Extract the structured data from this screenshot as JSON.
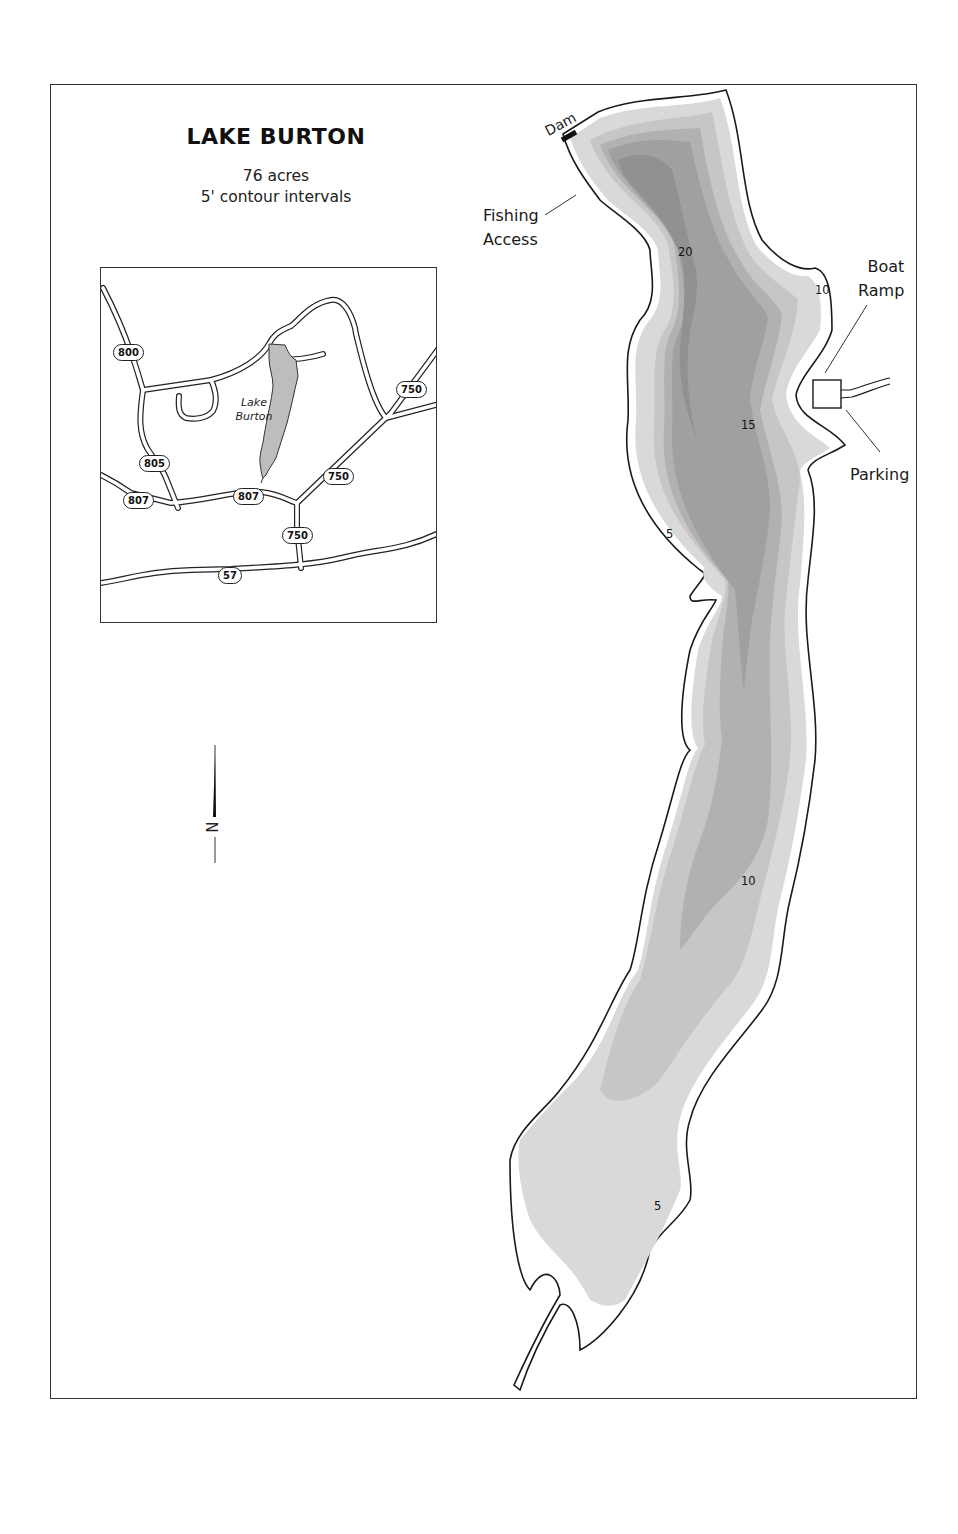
{
  "map": {
    "title": "LAKE BURTON",
    "area": "76 acres",
    "contour_note": "5' contour intervals",
    "north_label": "N"
  },
  "features": {
    "dam": "Dam",
    "fishing_access": [
      "Fishing",
      "Access"
    ],
    "boat_ramp": [
      "Boat",
      "Ramp"
    ],
    "parking": "Parking"
  },
  "depth_labels": [
    {
      "value": "20",
      "x": 678,
      "y": 245
    },
    {
      "value": "10",
      "x": 815,
      "y": 283
    },
    {
      "value": "15",
      "x": 741,
      "y": 418
    },
    {
      "value": "5",
      "x": 666,
      "y": 527
    },
    {
      "value": "10",
      "x": 741,
      "y": 874
    },
    {
      "value": "5",
      "x": 654,
      "y": 1199
    }
  ],
  "contour_colors": {
    "shore_0_5": "#d6d6d6",
    "depth_5_10": "#c4c4c4",
    "depth_10_15": "#b0b0b0",
    "depth_15_20": "#9e9e9e",
    "depth_20_plus": "#8f8f8f",
    "shoreline": "#1a1a1a"
  },
  "inset": {
    "lake_label": [
      "Lake",
      "Burton"
    ],
    "route_shields": [
      {
        "label": "800",
        "x": 12,
        "y": 76
      },
      {
        "label": "750",
        "x": 295,
        "y": 113
      },
      {
        "label": "805",
        "x": 38,
        "y": 187
      },
      {
        "label": "750",
        "x": 222,
        "y": 200
      },
      {
        "label": "807",
        "x": 22,
        "y": 224
      },
      {
        "label": "807",
        "x": 132,
        "y": 220
      },
      {
        "label": "750",
        "x": 181,
        "y": 259
      },
      {
        "label": "57",
        "x": 117,
        "y": 299
      }
    ]
  }
}
